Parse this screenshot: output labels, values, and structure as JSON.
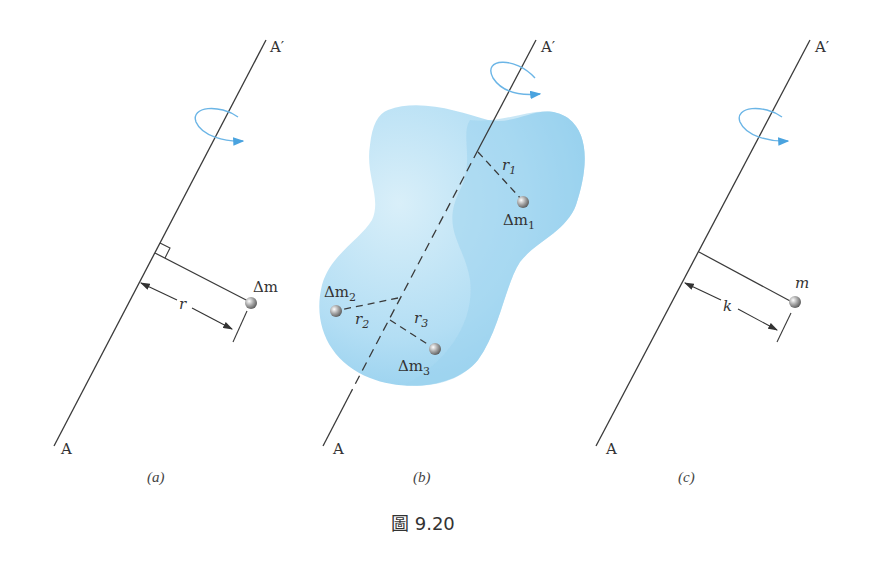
{
  "figure": {
    "title": "圖 9.20",
    "colors": {
      "axis": "#3a3a3a",
      "rotation_arrow": "#4aa3df",
      "body_fill_light": "#cde9f7",
      "body_fill_dark": "#8fcdee",
      "particle": "#9a9a9a"
    },
    "panels": [
      {
        "id": "a",
        "caption": "(a)",
        "axis_top_label": "A′",
        "axis_bottom_label": "A",
        "particle_label": "Δm",
        "distance_label": "r",
        "right_angle_marker": true
      },
      {
        "id": "b",
        "caption": "(b)",
        "axis_top_label": "A′",
        "axis_bottom_label": "A",
        "particles": [
          {
            "label": "Δm",
            "sub": "1",
            "distance": "r",
            "distance_sub": "1"
          },
          {
            "label": "Δm",
            "sub": "2",
            "distance": "r",
            "distance_sub": "2"
          },
          {
            "label": "Δm",
            "sub": "3",
            "distance": "r",
            "distance_sub": "3"
          }
        ]
      },
      {
        "id": "c",
        "caption": "(c)",
        "axis_top_label": "A′",
        "axis_bottom_label": "A",
        "particle_label": "m",
        "distance_label": "k"
      }
    ]
  }
}
